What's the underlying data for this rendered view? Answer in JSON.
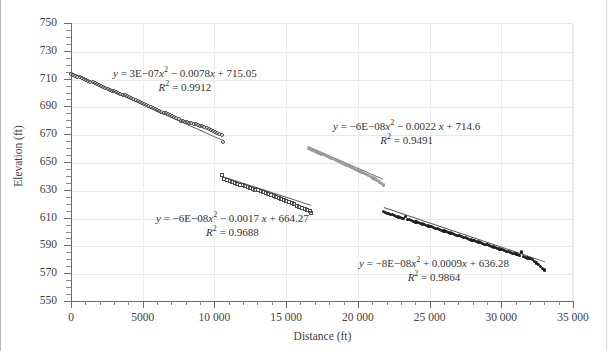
{
  "chart_data": {
    "type": "scatter",
    "title": "",
    "xlabel": "Distance (ft)",
    "ylabel": "Elevation (ft)",
    "xlim": [
      0,
      35000
    ],
    "ylim": [
      550,
      750
    ],
    "xticks": [
      0,
      5000,
      10000,
      15000,
      20000,
      25000,
      30000,
      35000
    ],
    "xtick_labels": [
      "0",
      "5000",
      "10 000",
      "15 000",
      "20 000",
      "25 000",
      "30 000",
      "35 000"
    ],
    "yticks": [
      550,
      570,
      590,
      610,
      630,
      650,
      670,
      690,
      710,
      730,
      750
    ],
    "ytick_labels": [
      "550",
      "570",
      "590",
      "610",
      "630",
      "650",
      "670",
      "690",
      "710",
      "730",
      "750"
    ],
    "y_minor_step": 5,
    "x_minor_step": 1000,
    "grid": "both-light",
    "legend": "none",
    "series": [
      {
        "name": "segment-1",
        "marker": "open-circle",
        "color": "#4a4a4a",
        "x": [
          0,
          150,
          300,
          450,
          600,
          750,
          900,
          1050,
          1200,
          1350,
          1500,
          1650,
          1800,
          1950,
          2100,
          2250,
          2400,
          2550,
          2700,
          2850,
          3000,
          3150,
          3300,
          3450,
          3600,
          3750,
          3900,
          4050,
          4200,
          4350,
          4500,
          4650,
          4800,
          4950,
          5100,
          5250,
          5400,
          5550,
          5700,
          5850,
          6000,
          6150,
          6300,
          6450,
          6600,
          6750,
          6900,
          7050,
          7200,
          7350,
          7500,
          7650,
          7800,
          7950,
          8100,
          8250,
          8400,
          8550,
          8700,
          8850,
          9000,
          9150,
          9300,
          9450,
          9600,
          9750,
          9900,
          10050,
          10200,
          10350,
          10500,
          10620
        ],
        "y": [
          713.5,
          712.6,
          712.0,
          711.5,
          710.8,
          710.3,
          709.6,
          709.1,
          708.4,
          707.9,
          707.2,
          706.6,
          705.9,
          705.3,
          704.5,
          703.9,
          703.4,
          702.8,
          702.0,
          701.4,
          700.8,
          700.1,
          699.5,
          699.0,
          698.3,
          697.9,
          697.4,
          696.6,
          695.9,
          695.0,
          694.4,
          693.6,
          692.9,
          692.3,
          691.6,
          691.0,
          690.2,
          689.6,
          688.9,
          688.2,
          687.6,
          686.9,
          686.3,
          685.6,
          684.9,
          684.2,
          683.5,
          682.8,
          682.1,
          681.4,
          680.6,
          679.8,
          679.4,
          679.0,
          678.6,
          678.2,
          677.8,
          677.4,
          677.0,
          676.6,
          676.1,
          675.6,
          675.0,
          674.4,
          673.8,
          673.2,
          672.5,
          671.8,
          671.1,
          670.3,
          669.6,
          664.3
        ],
        "trend_equation": "y = 3E−07x² − 0.0078x + 715.05",
        "r2_label": "R² = 0.9912",
        "r2_value": 0.9912,
        "coefficients": {
          "a": 3e-07,
          "b": -0.0078,
          "c": 715.05
        }
      },
      {
        "name": "segment-2",
        "marker": "gray-filled",
        "color": "#9a9a9a",
        "x": [
          16550,
          16700,
          16850,
          17000,
          17150,
          17300,
          17450,
          17600,
          17750,
          17900,
          18050,
          18200,
          18350,
          18500,
          18650,
          18800,
          18950,
          19100,
          19250,
          19400,
          19550,
          19700,
          19850,
          20000,
          20150,
          20300,
          20450,
          20600,
          20750,
          20900,
          21050,
          21200,
          21350,
          21500,
          21650,
          21800
        ],
        "y": [
          659.9,
          659.2,
          658.6,
          657.9,
          657.3,
          656.5,
          655.9,
          655.2,
          654.6,
          653.9,
          653.2,
          652.5,
          651.9,
          651.2,
          650.5,
          649.8,
          649.1,
          648.4,
          647.7,
          647.0,
          646.3,
          645.5,
          644.8,
          644.1,
          643.3,
          642.5,
          641.8,
          641.0,
          640.2,
          639.4,
          638.6,
          637.7,
          636.8,
          635.7,
          634.6,
          633.4
        ],
        "trend_equation": "y = −6E−08x² − 0.0022 x + 714.6",
        "r2_label": "R² = 0.9491",
        "r2_value": 0.9491,
        "coefficients": {
          "a": -6e-08,
          "b": -0.0022,
          "c": 714.6
        }
      },
      {
        "name": "segment-3",
        "marker": "open-square",
        "color": "#4a4a4a",
        "x": [
          10520,
          10700,
          10880,
          11060,
          11240,
          11420,
          11600,
          11780,
          11960,
          12140,
          12320,
          12500,
          12680,
          12860,
          13040,
          13220,
          13400,
          13580,
          13760,
          13940,
          14120,
          14300,
          14480,
          14660,
          14840,
          15020,
          15200,
          15380,
          15560,
          15740,
          15920,
          16100,
          16280,
          16460,
          16640,
          16750
        ],
        "y": [
          640.4,
          637.8,
          636.9,
          636.2,
          635.6,
          635.0,
          634.4,
          633.8,
          633.2,
          632.6,
          632.0,
          631.4,
          630.8,
          630.2,
          629.6,
          629.0,
          628.4,
          627.7,
          627.0,
          626.3,
          625.5,
          624.8,
          624.0,
          623.2,
          622.5,
          621.8,
          621.0,
          620.2,
          619.5,
          618.7,
          617.9,
          617.1,
          616.3,
          615.5,
          614.6,
          613.6
        ],
        "trend_equation": "y = −6E−08x² − 0.0017 x + 664.27",
        "r2_label": "R² = 0.9688",
        "r2_value": 0.9688,
        "coefficients": {
          "a": -6e-08,
          "b": -0.0017,
          "c": 664.27
        }
      },
      {
        "name": "segment-4",
        "marker": "dark-filled",
        "color": "#1d1d1d",
        "x": [
          21800,
          21950,
          22100,
          22250,
          22400,
          22550,
          22700,
          22850,
          23000,
          23150,
          23300,
          23450,
          23600,
          23750,
          23900,
          24050,
          24200,
          24350,
          24500,
          24650,
          24800,
          24950,
          25100,
          25250,
          25400,
          25550,
          25700,
          25850,
          26000,
          26150,
          26300,
          26450,
          26600,
          26750,
          26900,
          27050,
          27200,
          27350,
          27500,
          27650,
          27800,
          27950,
          28100,
          28250,
          28400,
          28550,
          28700,
          28850,
          29000,
          29150,
          29300,
          29450,
          29600,
          29750,
          29900,
          30050,
          30200,
          30350,
          30500,
          30650,
          30800,
          30950,
          31100,
          31250,
          31400,
          31550,
          31700,
          31850,
          32000,
          32150,
          32300,
          32450,
          32600,
          32750,
          32900,
          33000
        ],
        "y": [
          614.2,
          613.6,
          613.1,
          612.5,
          612.0,
          611.5,
          611.0,
          610.4,
          609.9,
          609.4,
          610.8,
          608.9,
          608.4,
          607.9,
          607.4,
          606.9,
          606.4,
          605.9,
          605.4,
          604.9,
          604.4,
          603.9,
          603.4,
          602.9,
          602.4,
          601.9,
          601.4,
          600.9,
          600.4,
          599.9,
          599.4,
          598.9,
          598.4,
          597.9,
          597.4,
          596.9,
          596.4,
          595.9,
          595.4,
          594.9,
          594.4,
          593.9,
          593.4,
          592.9,
          592.4,
          591.9,
          591.4,
          590.9,
          590.4,
          589.9,
          589.4,
          588.9,
          588.4,
          587.9,
          587.4,
          586.9,
          586.4,
          585.9,
          585.4,
          584.9,
          584.4,
          583.9,
          583.4,
          582.9,
          585.3,
          581.9,
          581.4,
          580.9,
          580.4,
          579.9,
          578.6,
          577.3,
          576.0,
          574.7,
          573.4,
          572.3
        ],
        "trend_equation": "y = −8E−08x² + 0.0009x + 636.28",
        "r2_label": "R² = 0.9864",
        "r2_value": 0.9864,
        "coefficients": {
          "a": -8e-08,
          "b": 0.0009,
          "c": 636.28
        }
      }
    ],
    "annotations": [
      {
        "id": "eq1",
        "text_line1": "y = 3E−07x² − 0.0078x + 715.05",
        "text_line2": "R² = 0.9912"
      },
      {
        "id": "eq2",
        "text_line1": "y = −6E−08x² − 0.0022 x + 714.6",
        "text_line2": "R² = 0.9491"
      },
      {
        "id": "eq3",
        "text_line1": "y = −6E−08x² − 0.0017 x + 664.27",
        "text_line2": "R² = 0.9688"
      },
      {
        "id": "eq4",
        "text_line1": "y = −8E−08x² + 0.0009x + 636.28",
        "text_line2": "R² = 0.9864"
      }
    ]
  }
}
